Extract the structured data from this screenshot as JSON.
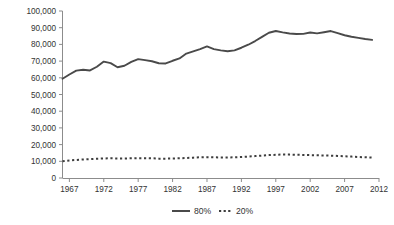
{
  "chart_data": {
    "type": "line",
    "title": "",
    "subtitle": "",
    "xlabel": "",
    "ylabel": "",
    "xlim": [
      1966,
      2012
    ],
    "ylim": [
      0,
      100000
    ],
    "grid": false,
    "legend_position": "bottom-center",
    "y_ticks": [
      0,
      10000,
      20000,
      30000,
      40000,
      50000,
      60000,
      70000,
      80000,
      90000,
      100000
    ],
    "y_tick_labels": [
      "0",
      "10,000",
      "20,000",
      "30,000",
      "40,000",
      "50,000",
      "60,000",
      "70,000",
      "80,000",
      "90,000",
      "100,000"
    ],
    "x_ticks": [
      1967,
      1972,
      1977,
      1982,
      1987,
      1992,
      1997,
      2002,
      2007,
      2012
    ],
    "x_tick_labels": [
      "1967",
      "1972",
      "1977",
      "1982",
      "1987",
      "1992",
      "1997",
      "2002",
      "2007",
      "2012"
    ],
    "x": [
      1966,
      1967,
      1968,
      1969,
      1970,
      1971,
      1972,
      1973,
      1974,
      1975,
      1976,
      1977,
      1978,
      1979,
      1980,
      1981,
      1982,
      1983,
      1984,
      1985,
      1986,
      1987,
      1988,
      1989,
      1990,
      1991,
      1992,
      1993,
      1994,
      1995,
      1996,
      1997,
      1998,
      1999,
      2000,
      2001,
      2002,
      2003,
      2004,
      2005,
      2006,
      2007,
      2008,
      2009,
      2010,
      2011
    ],
    "series": [
      {
        "name": "80%",
        "style": "solid",
        "color": "#4a4a4a",
        "values": [
          59400,
          62000,
          64300,
          64800,
          64400,
          66600,
          69700,
          68800,
          66300,
          67200,
          69500,
          71200,
          70600,
          69900,
          68700,
          68600,
          70200,
          71600,
          74500,
          75800,
          77200,
          78800,
          77200,
          76400,
          75900,
          76400,
          78000,
          79800,
          82000,
          84500,
          87000,
          88000,
          87200,
          86500,
          86200,
          86300,
          87100,
          86600,
          87300,
          88000,
          86700,
          85500,
          84600,
          83900,
          83200,
          82700
        ]
      },
      {
        "name": "20%",
        "style": "dotted",
        "color": "#3d3d3d",
        "values": [
          10000,
          10500,
          10800,
          11100,
          11300,
          11500,
          11700,
          11800,
          11700,
          11700,
          11800,
          11900,
          11900,
          11800,
          11600,
          11600,
          11700,
          11800,
          12000,
          12200,
          12400,
          12500,
          12400,
          12300,
          12300,
          12400,
          12600,
          12800,
          13100,
          13400,
          13700,
          13900,
          14100,
          14000,
          13900,
          13800,
          13700,
          13600,
          13500,
          13400,
          13200,
          13000,
          12800,
          12600,
          12400,
          12200
        ]
      }
    ],
    "legend": [
      {
        "label": "80%",
        "style": "solid"
      },
      {
        "label": "20%",
        "style": "dotted"
      }
    ]
  },
  "colors": {
    "axis": "#8c8c8c",
    "text": "#333333",
    "series_80": "#4a4a4a",
    "series_20": "#3d3d3d",
    "background": "#ffffff"
  }
}
